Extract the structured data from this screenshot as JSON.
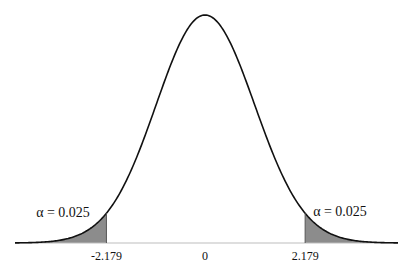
{
  "chart_data": {
    "type": "area",
    "title": "",
    "subtitle": "",
    "xlabel": "",
    "ylabel": "",
    "distribution": "t (two-tailed), shown as bell-shaped density curve",
    "center": 0,
    "x_range": [
      -4.2,
      4.2
    ],
    "grid": false,
    "legend": "none",
    "critical_values": [
      -2.179,
      2.179
    ],
    "tick_labels": [
      {
        "value": -2.179,
        "label": "-2.179"
      },
      {
        "value": 0,
        "label": "0"
      },
      {
        "value": 2.179,
        "label": "2.179"
      }
    ],
    "shaded_regions": [
      {
        "name": "left-tail",
        "from": -4.2,
        "to": -2.179,
        "annotation": "α = 0.025"
      },
      {
        "name": "right-tail",
        "from": 2.179,
        "to": 4.2,
        "annotation": "α = 0.025"
      }
    ],
    "annotations": {
      "left": "α = 0.025",
      "right": "α = 0.025"
    },
    "colors": {
      "curve": "#111111",
      "shade": "#8c8c8c",
      "axis": "#bdbdbd"
    }
  }
}
